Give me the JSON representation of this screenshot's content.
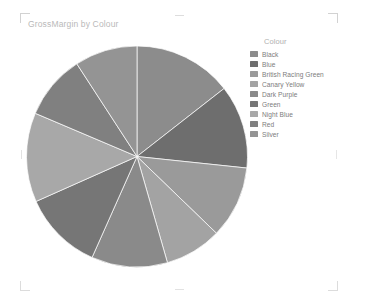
{
  "visual": {
    "title": "GrossMargin by Colour",
    "type": "pie"
  },
  "legend": {
    "title": "Colour",
    "items": [
      {
        "label": "Black",
        "color": "#8c8c8c"
      },
      {
        "label": "Blue",
        "color": "#6e6e6e"
      },
      {
        "label": "British Racing Green",
        "color": "#9a9a9a"
      },
      {
        "label": "Canary Yellow",
        "color": "#a3a3a3"
      },
      {
        "label": "Dark Purple",
        "color": "#8a8a8a"
      },
      {
        "label": "Green",
        "color": "#767676"
      },
      {
        "label": "Night Blue",
        "color": "#a8a8a8"
      },
      {
        "label": "Red",
        "color": "#808080"
      },
      {
        "label": "Silver",
        "color": "#949494"
      }
    ]
  },
  "chart_data": {
    "type": "pie",
    "title": "GrossMargin by Colour",
    "legend_title": "Colour",
    "legend_position": "right",
    "categories": [
      "Black",
      "Blue",
      "British Racing Green",
      "Canary Yellow",
      "Dark Purple",
      "Green",
      "Night Blue",
      "Red",
      "Silver"
    ],
    "values": [
      52,
      44,
      38,
      30,
      40,
      42,
      47,
      34,
      33
    ],
    "percentages": [
      14.4,
      12.2,
      10.6,
      8.3,
      11.1,
      11.7,
      13.1,
      9.4,
      9.2
    ],
    "colors": [
      "#8c8c8c",
      "#6e6e6e",
      "#9a9a9a",
      "#a3a3a3",
      "#8a8a8a",
      "#767676",
      "#a8a8a8",
      "#808080",
      "#949494"
    ],
    "start_angle_deg": -90,
    "direction": "clockwise",
    "data_labels": false,
    "geometry": {
      "cx": 111,
      "cy": 111.5,
      "r": 110.5
    }
  }
}
